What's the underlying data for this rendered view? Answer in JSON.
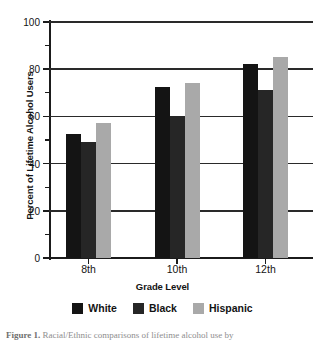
{
  "figure": {
    "caption": "Figure 1.   Racial/Ethnic comparisons of lifetime alcohol use by"
  },
  "chart_data": {
    "type": "bar",
    "title": "",
    "xlabel": "Grade Level",
    "ylabel": "Percent of Lifetime Alcohol Users",
    "categories": [
      "8th",
      "10th",
      "12th"
    ],
    "series": [
      {
        "name": "White",
        "color": "#141414",
        "values": [
          52.5,
          72.5,
          82.0
        ]
      },
      {
        "name": "Black",
        "color": "#262626",
        "values": [
          49.0,
          60.0,
          71.0
        ]
      },
      {
        "name": "Hispanic",
        "color": "#a9a9a9",
        "values": [
          57.0,
          74.0,
          85.0
        ]
      }
    ],
    "ylim": [
      0,
      100
    ],
    "ytick_labels": [
      "0",
      "20",
      "40",
      "60",
      "80",
      "100"
    ],
    "ytick_values": [
      0,
      20,
      40,
      60,
      80,
      100
    ],
    "yminor_values": [
      10,
      30,
      50,
      70,
      90
    ],
    "grid": true,
    "legend_position": "bottom"
  }
}
